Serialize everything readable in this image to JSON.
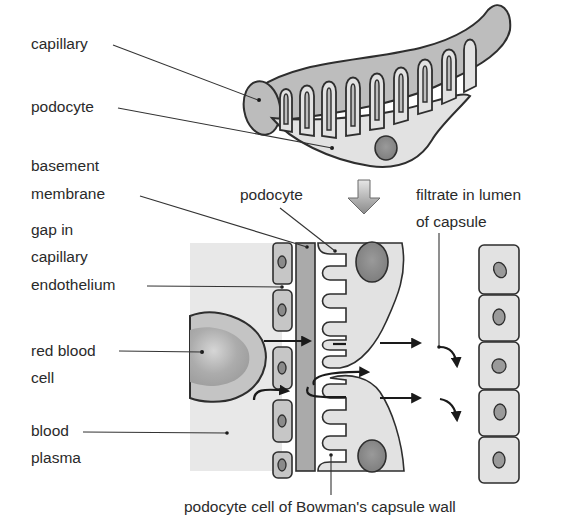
{
  "diagram": {
    "colors": {
      "background": "#ffffff",
      "text": "#2a2a2a",
      "outline": "#2e2e2e",
      "capillary_fill": "#bdbdbd",
      "podocyte_fill": "#e2e2e2",
      "plasma_fill": "#e8e8e8",
      "nucleus_fill": "#8f8f8f",
      "basement_membrane_fill": "#a9a9a9",
      "red_blood_cell_fill": "#b8b8b8"
    },
    "top_view": {
      "labels": {
        "capillary": "capillary",
        "podocyte": "podocyte"
      }
    },
    "zoom_arrow": "down-arrow",
    "detail_view": {
      "labels": {
        "basement_membrane_line1": "basement",
        "basement_membrane_line2": "membrane",
        "gap_line1": "gap in",
        "gap_line2": "capillary",
        "gap_line3": "endothelium",
        "rbc_line1": "red blood",
        "rbc_line2": "cell",
        "plasma_line1": "blood",
        "plasma_line2": "plasma",
        "podocyte": "podocyte",
        "filtrate_line1": "filtrate in lumen",
        "filtrate_line2": "of capsule",
        "bottom_caption": "podocyte cell of Bowman's capsule wall"
      },
      "endothelial_cells": 5,
      "capsule_wall_cells": 5
    }
  }
}
